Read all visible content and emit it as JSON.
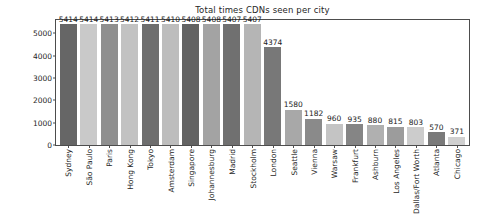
{
  "chart_data": {
    "type": "bar",
    "title": "Total times CDNs seen per city",
    "xlabel": "",
    "ylabel": "Times CDN Seen",
    "ylim": [
      0,
      5600
    ],
    "yticks": [
      0,
      1000,
      2000,
      3000,
      4000,
      5000
    ],
    "ytick_labels": [
      "0",
      "1000",
      "2000",
      "3000",
      "4000",
      "5000"
    ],
    "grid": false,
    "legend": null,
    "categories": [
      "Sydney",
      "São Paulo",
      "Paris",
      "Hong Kong",
      "Tokyo",
      "Amsterdam",
      "Singapore",
      "Johannesburg",
      "Madrid",
      "Stockholm",
      "London",
      "Seattle",
      "Vienna",
      "Warsaw",
      "Frankfurt",
      "Ashburn",
      "Los Angeles",
      "Dallas/Fort Worth",
      "Atlanta",
      "Chicago"
    ],
    "values": [
      5414,
      5414,
      5413,
      5412,
      5411,
      5410,
      5408,
      5408,
      5407,
      5407,
      4374,
      1580,
      1182,
      960,
      935,
      880,
      815,
      803,
      570,
      371
    ],
    "value_labels": [
      "5414",
      "5414",
      "5413",
      "5412",
      "5411",
      "5410",
      "5408",
      "5408",
      "5407",
      "5407",
      "4374",
      "1580",
      "1182",
      "960",
      "935",
      "880",
      "815",
      "803",
      "570",
      "371"
    ],
    "bar_colors": [
      "#666666",
      "#c9c9c9",
      "#8f8f8f",
      "#c2c2c2",
      "#6e6e6e",
      "#bdbdbd",
      "#636363",
      "#a3a3a3",
      "#707070",
      "#b5b5b5",
      "#787878",
      "#a8a8a8",
      "#8a8a8a",
      "#c4c4c4",
      "#858585",
      "#b0b0b0",
      "#9c9c9c",
      "#cccccc",
      "#7a7a7a",
      "#d0d0d0"
    ],
    "colors": {
      "background": "#ffffff",
      "axis": "#4d4d4d",
      "text": "#262626",
      "value_text": "#1a1a1a"
    }
  }
}
